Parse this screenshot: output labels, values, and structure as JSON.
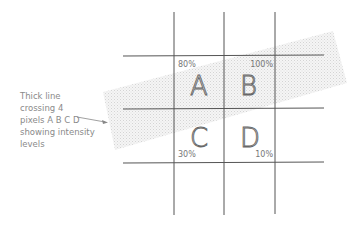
{
  "caption": {
    "line1": "Thick line",
    "line2": "crossing 4",
    "line3": "pixels A B C D",
    "line4": "showing intensity",
    "line5": "levels"
  },
  "pixels": [
    {
      "letter": "A",
      "intensity": "80%"
    },
    {
      "letter": "B",
      "intensity": "100%"
    },
    {
      "letter": "C",
      "intensity": "30%"
    },
    {
      "letter": "D",
      "intensity": "10%"
    }
  ],
  "colors": {
    "grid_line": "#555555",
    "band": "#e6e6e6",
    "text": "#8a8a8a"
  }
}
